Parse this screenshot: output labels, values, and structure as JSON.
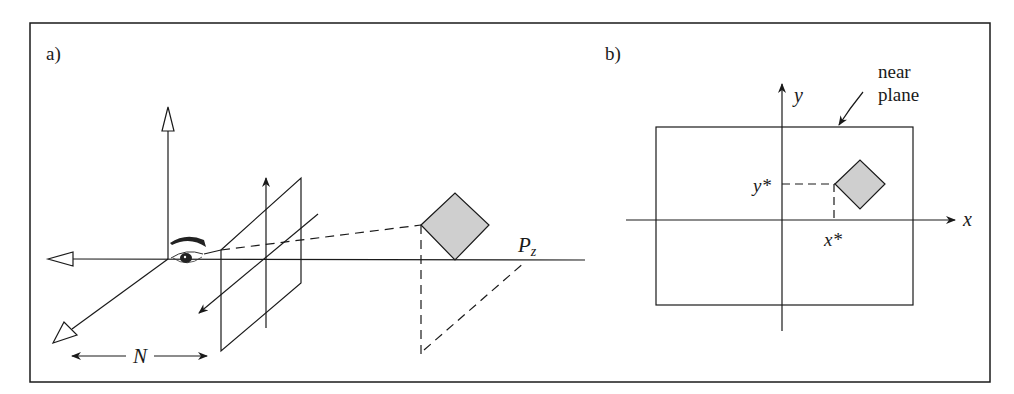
{
  "figure": {
    "panel_a": {
      "label": "a)",
      "n_label": "N",
      "pz_label_main": "P",
      "pz_label_sub": "z"
    },
    "panel_b": {
      "label": "b)",
      "y_axis_label": "y",
      "x_axis_label": "x",
      "y_star_label": "y*",
      "x_star_label": "x*",
      "near_plane_label_line1": "near",
      "near_plane_label_line2": "plane"
    },
    "colors": {
      "stroke": "#1a1a1a",
      "diamond_fill": "#cfcfcf",
      "background": "#ffffff"
    }
  }
}
